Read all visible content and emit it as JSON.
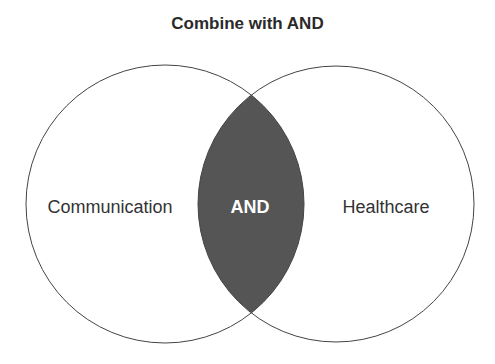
{
  "title": "Combine with AND",
  "diagram": {
    "type": "venn",
    "sets": [
      {
        "label": "Communication",
        "cx": 165,
        "cy": 204,
        "r": 139
      },
      {
        "label": "Healthcare",
        "cx": 336,
        "cy": 204,
        "r": 138
      }
    ],
    "intersection": {
      "label": "AND",
      "fill": "#555555"
    },
    "stroke": "#444444",
    "text_color": "#333333"
  }
}
